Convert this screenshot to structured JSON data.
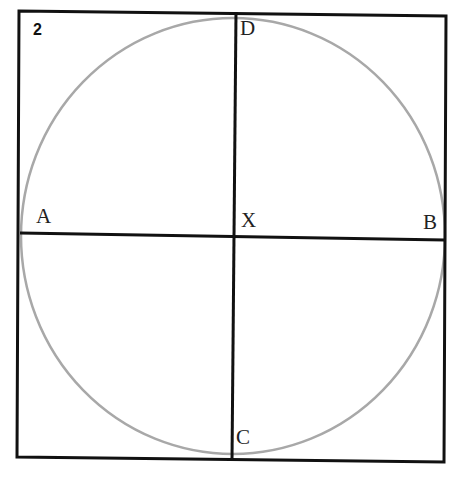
{
  "figure": {
    "number": "2",
    "points": {
      "A": "A",
      "B": "B",
      "C": "C",
      "D": "D",
      "X": "X"
    }
  },
  "colors": {
    "square_stroke": "#111111",
    "diameter_stroke": "#111111",
    "circle_stroke": "#a8a8a8",
    "background": "#ffffff"
  }
}
